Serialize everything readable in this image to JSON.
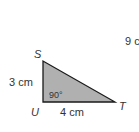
{
  "diagram": {
    "vertices": {
      "S": "S",
      "U": "U",
      "T": "T"
    },
    "sides": {
      "SU": "3 cm",
      "UT": "4 cm"
    },
    "angle": "90°",
    "partial_text": "9 c",
    "fill_color": "#b0b0b0",
    "stroke_color": "#1a1a1a"
  }
}
